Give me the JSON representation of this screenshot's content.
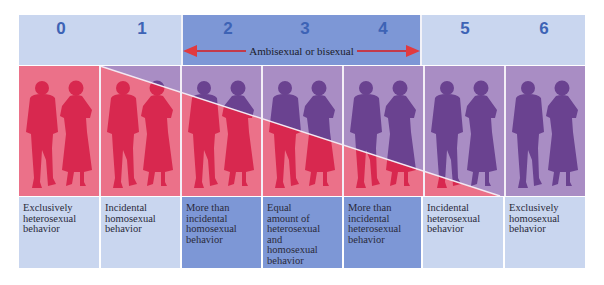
{
  "figure": {
    "colors": {
      "header_light": "#c9d6ef",
      "header_dark": "#7d97d6",
      "heterosexual_red": "#eb7189",
      "homosexual_purple": "#a98dc4",
      "silhouette_red": "#d8284f",
      "silhouette_purple": "#6a4290",
      "arrow_red": "#c33a4a",
      "number_blue": "#3d63b5"
    },
    "ambisexual_range": {
      "label": "Ambisexual or bisexual",
      "from": 2,
      "to": 4
    },
    "scale": [
      {
        "rating": "0",
        "description": "Exclusively heterosexual behavior",
        "lines": [
          "Exclusively",
          "heterosexual",
          "behavior"
        ]
      },
      {
        "rating": "1",
        "description": "Incidental homosexual behavior",
        "lines": [
          "Incidental",
          "homosexual",
          "behavior"
        ]
      },
      {
        "rating": "2",
        "description": "More than incidental homosexual behavior",
        "lines": [
          "More than",
          "incidental",
          "homosexual",
          "behavior"
        ]
      },
      {
        "rating": "3",
        "description": "Equal amount of heterosexual and homosexual behavior",
        "lines": [
          "Equal",
          "amount of",
          "heterosexual",
          "and",
          "homosexual",
          "behavior"
        ]
      },
      {
        "rating": "4",
        "description": "More than incidental heterosexual behavior",
        "lines": [
          "More than",
          "incidental",
          "heterosexual",
          "behavior"
        ]
      },
      {
        "rating": "5",
        "description": "Incidental heterosexual behavior",
        "lines": [
          "Incidental",
          "heterosexual",
          "behavior"
        ]
      },
      {
        "rating": "6",
        "description": "Exclusively homosexual behavior",
        "lines": [
          "Exclusively",
          "homosexual",
          "behavior"
        ]
      }
    ],
    "icons": {
      "figure_pair": "man-and-woman-silhouette-icon",
      "arrow_left": "arrow-left-icon",
      "arrow_right": "arrow-right-icon"
    }
  }
}
